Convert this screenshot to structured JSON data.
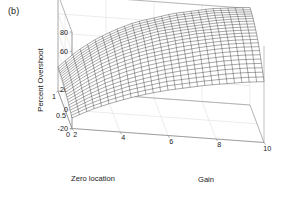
{
  "figure": {
    "panel_label": "(b)",
    "background_color": "#ffffff",
    "axis_color": "#8c8c8c",
    "grid_color": "#d8d8d8",
    "mesh_color": "#1a1a1a",
    "text_color": "#1a1a1a"
  },
  "chart_data": {
    "type": "line",
    "subtype": "surface-mesh-3d",
    "title": "",
    "xlabel": "Gain",
    "ylabel": "Zero location",
    "zlabel": "Percent Overshoot",
    "grid": true,
    "legend": "none",
    "xlim": [
      2,
      10
    ],
    "ylim": [
      0,
      1
    ],
    "zlim": [
      -20,
      80
    ],
    "xticks": [
      2,
      4,
      6,
      8,
      10
    ],
    "xticklabels": [
      "2",
      "4",
      "6",
      "8",
      "10"
    ],
    "yticks": [
      0,
      0.5,
      1
    ],
    "yticklabels": [
      "0",
      "0.5",
      "1"
    ],
    "zticks": [
      -20,
      0,
      20,
      40,
      60,
      80
    ],
    "zticklabels": [
      "-20",
      "0",
      "20",
      "40",
      "60",
      "80"
    ],
    "view": {
      "azimuth": -37.5,
      "elevation": 30
    },
    "x": [
      2,
      2.8,
      3.6,
      4.4,
      5.2,
      6,
      6.8,
      7.6,
      8.4,
      9.2,
      10
    ],
    "y": [
      0,
      0.1,
      0.2,
      0.3,
      0.4,
      0.5,
      0.6,
      0.7,
      0.8,
      0.9,
      1
    ],
    "z_rows_by_y": [
      {
        "y": 0.0,
        "values": [
          -9,
          1,
          9,
          16,
          22,
          27,
          31,
          35,
          38,
          41,
          43
        ]
      },
      {
        "y": 0.1,
        "values": [
          -7,
          4,
          13,
          21,
          27,
          33,
          37,
          41,
          45,
          48,
          50
        ]
      },
      {
        "y": 0.2,
        "values": [
          -5,
          7,
          17,
          25,
          32,
          38,
          43,
          47,
          51,
          54,
          56
        ]
      },
      {
        "y": 0.3,
        "values": [
          -3,
          10,
          21,
          30,
          37,
          43,
          48,
          53,
          57,
          60,
          62
        ]
      },
      {
        "y": 0.4,
        "values": [
          -1,
          13,
          25,
          34,
          42,
          48,
          53,
          58,
          62,
          65,
          67
        ]
      },
      {
        "y": 0.5,
        "values": [
          1,
          16,
          28,
          38,
          46,
          52,
          58,
          62,
          66,
          69,
          71
        ]
      },
      {
        "y": 0.6,
        "values": [
          2,
          18,
          31,
          41,
          49,
          56,
          61,
          66,
          69,
          72,
          74
        ]
      },
      {
        "y": 0.7,
        "values": [
          3,
          20,
          33,
          44,
          52,
          59,
          64,
          68,
          72,
          75,
          77
        ]
      },
      {
        "y": 0.8,
        "values": [
          4,
          21,
          35,
          46,
          54,
          61,
          66,
          70,
          74,
          77,
          79
        ]
      },
      {
        "y": 0.9,
        "values": [
          4,
          22,
          36,
          47,
          56,
          62,
          68,
          72,
          76,
          78,
          80
        ]
      },
      {
        "y": 1.0,
        "values": [
          5,
          23,
          37,
          48,
          57,
          63,
          69,
          73,
          77,
          79,
          81
        ]
      }
    ]
  }
}
